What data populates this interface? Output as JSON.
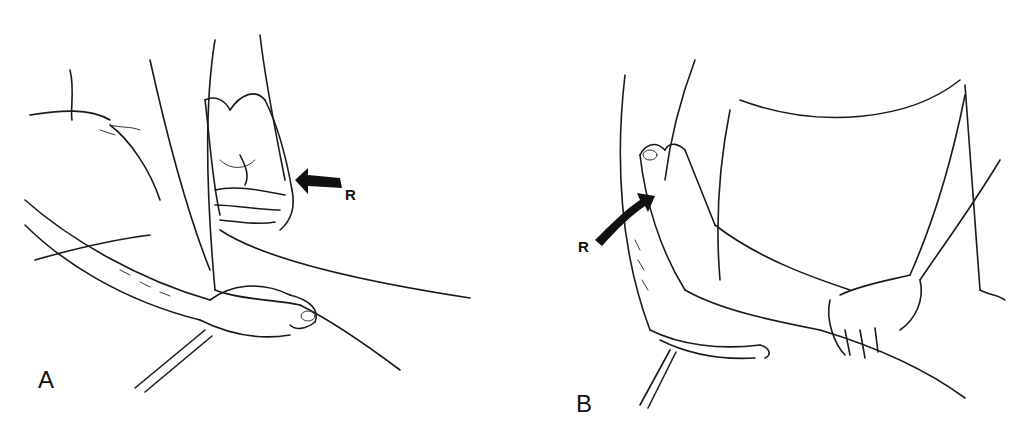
{
  "figure": {
    "panels": [
      {
        "id": "A",
        "label": "A",
        "arrow_label": "R",
        "description": "Examiner's hand grasps dorsum of the foot/toes, other hand stabilizes heel; arrow R applies resistance from the right"
      },
      {
        "id": "B",
        "label": "B",
        "arrow_label": "R",
        "description": "Examiner's hand on plantar surface of foot with toes, other hand stabilizes the leg; curved arrow R indicates resistance"
      }
    ],
    "colors": {
      "line": "#1a1a1a",
      "background": "#ffffff"
    }
  }
}
